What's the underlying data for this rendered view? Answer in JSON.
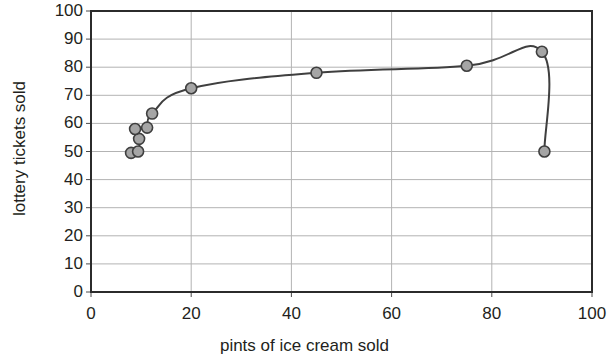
{
  "chart_data": {
    "type": "scatter",
    "title": "",
    "subtitle": "",
    "xlabel": "pints of ice cream sold",
    "ylabel": "lottery tickets sold",
    "xlim": [
      0,
      100
    ],
    "ylim": [
      0,
      100
    ],
    "xticks": [
      "0",
      "20",
      "40",
      "60",
      "80",
      "100"
    ],
    "xtick_values": [
      0,
      20,
      40,
      60,
      80,
      100
    ],
    "yticks": [
      "0",
      "10",
      "20",
      "30",
      "40",
      "50",
      "60",
      "70",
      "80",
      "90",
      "100"
    ],
    "ytick_values": [
      0,
      10,
      20,
      30,
      40,
      50,
      60,
      70,
      80,
      90,
      100
    ],
    "grid": "horizontal-and-vertical",
    "grid_color": "#b3b3b3",
    "legend": "none",
    "marker": {
      "shape": "circle",
      "fill_color": "#a5a5a5",
      "edge_color": "#3f3f3f",
      "size_px": 11
    },
    "line": {
      "connected": true,
      "smooth": true,
      "color": "#3f3f3f",
      "width_px": 2
    },
    "series": [
      {
        "name": "lottery tickets vs pints of ice cream",
        "points": [
          {
            "x": 8.0,
            "y": 49.5
          },
          {
            "x": 9.4,
            "y": 50.0
          },
          {
            "x": 9.6,
            "y": 54.5
          },
          {
            "x": 8.8,
            "y": 58.0
          },
          {
            "x": 11.2,
            "y": 58.5
          },
          {
            "x": 12.2,
            "y": 63.5
          },
          {
            "x": 20.0,
            "y": 72.5
          },
          {
            "x": 45.0,
            "y": 78.0
          },
          {
            "x": 75.0,
            "y": 80.5
          },
          {
            "x": 90.0,
            "y": 85.5
          },
          {
            "x": 90.5,
            "y": 50.0
          }
        ],
        "x": [
          8.0,
          9.4,
          9.6,
          8.8,
          11.2,
          12.2,
          20.0,
          45.0,
          75.0,
          90.0,
          90.5
        ],
        "y": [
          49.5,
          50.0,
          54.5,
          58.0,
          58.5,
          63.5,
          72.5,
          78.0,
          80.5,
          85.5,
          50.0
        ]
      }
    ],
    "path_order": [
      {
        "x": 8.0,
        "y": 49.5
      },
      {
        "x": 9.4,
        "y": 50.0
      },
      {
        "x": 9.6,
        "y": 54.5
      },
      {
        "x": 8.8,
        "y": 58.0
      },
      {
        "x": 11.2,
        "y": 58.5
      },
      {
        "x": 12.2,
        "y": 63.5
      },
      {
        "x": 20.0,
        "y": 72.5
      },
      {
        "x": 45.0,
        "y": 78.0
      },
      {
        "x": 75.0,
        "y": 80.5
      },
      {
        "x": 90.0,
        "y": 85.5
      },
      {
        "x": 90.5,
        "y": 50.0
      }
    ]
  },
  "plot_geometry": {
    "left_px": 91,
    "right_px": 592,
    "top_px": 11,
    "bottom_px": 292,
    "frame_color": "#2b2b2b"
  }
}
